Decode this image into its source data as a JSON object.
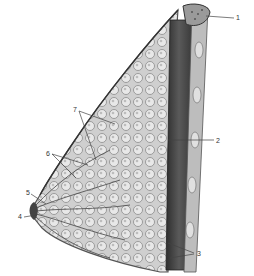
{
  "figure": {
    "labels": [
      {
        "id": "1",
        "text": "1",
        "x": 236,
        "y": 15
      },
      {
        "id": "2",
        "text": "2",
        "x": 216,
        "y": 138
      },
      {
        "id": "3",
        "text": "3",
        "x": 198,
        "y": 250
      },
      {
        "id": "4",
        "text": "4",
        "x": 19,
        "y": 214
      },
      {
        "id": "5",
        "text": "5",
        "x": 27,
        "y": 191
      },
      {
        "id": "6",
        "text": "6",
        "x": 47,
        "y": 151
      },
      {
        "id": "7",
        "text": "7",
        "x": 74,
        "y": 108
      }
    ],
    "colors": {
      "tissue_light": "#d9d9d9",
      "tissue_mid": "#9a9a9a",
      "tissue_dark": "#3a3a3a",
      "leader_line": "#444444"
    }
  }
}
